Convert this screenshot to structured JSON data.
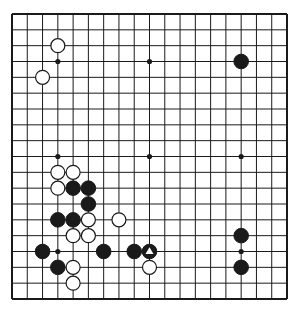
{
  "board": {
    "size": 19,
    "origin": {
      "x": 12,
      "y": 14
    },
    "end": {
      "x": 287,
      "y": 299
    },
    "line_color": "#1a1a1a",
    "background": "#ffffff",
    "star_points": [
      [
        3,
        3
      ],
      [
        9,
        3
      ],
      [
        15,
        3
      ],
      [
        3,
        9
      ],
      [
        9,
        9
      ],
      [
        15,
        9
      ],
      [
        3,
        15
      ],
      [
        9,
        15
      ],
      [
        15,
        15
      ]
    ]
  },
  "stones": [
    {
      "col": 3,
      "row": 2,
      "color": "white"
    },
    {
      "col": 2,
      "row": 4,
      "color": "white"
    },
    {
      "col": 15,
      "row": 3,
      "color": "black"
    },
    {
      "col": 3,
      "row": 10,
      "color": "white"
    },
    {
      "col": 4,
      "row": 10,
      "color": "white"
    },
    {
      "col": 3,
      "row": 11,
      "color": "white"
    },
    {
      "col": 4,
      "row": 11,
      "color": "black"
    },
    {
      "col": 5,
      "row": 11,
      "color": "black"
    },
    {
      "col": 5,
      "row": 12,
      "color": "black"
    },
    {
      "col": 3,
      "row": 13,
      "color": "black"
    },
    {
      "col": 4,
      "row": 13,
      "color": "black"
    },
    {
      "col": 5,
      "row": 13,
      "color": "white"
    },
    {
      "col": 7,
      "row": 13,
      "color": "white"
    },
    {
      "col": 4,
      "row": 14,
      "color": "white"
    },
    {
      "col": 5,
      "row": 14,
      "color": "white"
    },
    {
      "col": 15,
      "row": 14,
      "color": "black"
    },
    {
      "col": 2,
      "row": 15,
      "color": "black"
    },
    {
      "col": 6,
      "row": 15,
      "color": "black"
    },
    {
      "col": 8,
      "row": 15,
      "color": "black"
    },
    {
      "col": 9,
      "row": 15,
      "color": "black",
      "marker": "triangle"
    },
    {
      "col": 3,
      "row": 16,
      "color": "black"
    },
    {
      "col": 4,
      "row": 16,
      "color": "white"
    },
    {
      "col": 9,
      "row": 16,
      "color": "white"
    },
    {
      "col": 15,
      "row": 16,
      "color": "black"
    },
    {
      "col": 4,
      "row": 17,
      "color": "white"
    }
  ]
}
